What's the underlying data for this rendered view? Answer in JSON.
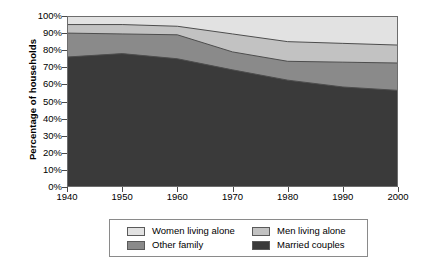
{
  "chart_data": {
    "type": "area",
    "stacked": true,
    "title": "",
    "xlabel": "",
    "ylabel": "Percentage of households",
    "x": [
      1940,
      1950,
      1960,
      1970,
      1980,
      1990,
      2000
    ],
    "xlim": [
      1940,
      2000
    ],
    "ylim": [
      0,
      100
    ],
    "grid": false,
    "legend_position": "bottom",
    "x_tick_labels": [
      "1940",
      "1950",
      "1960",
      "1970",
      "1980",
      "1990",
      "2000"
    ],
    "y_tick_labels": [
      "0%",
      "10%",
      "20%",
      "30%",
      "40%",
      "50%",
      "60%",
      "70%",
      "80%",
      "90%",
      "100%"
    ],
    "y_tick_values": [
      0,
      10,
      20,
      30,
      40,
      50,
      60,
      70,
      80,
      90,
      100
    ],
    "series": [
      {
        "name": "Married couples",
        "color": "#3a3a3a",
        "values": [
          76,
          78,
          75,
          68.5,
          62.5,
          58.5,
          56.5
        ]
      },
      {
        "name": "Other family",
        "color": "#8a8a8a",
        "values": [
          14,
          11.5,
          14,
          10.5,
          11,
          14.5,
          16
        ]
      },
      {
        "name": "Men living alone",
        "color": "#c2c2c2",
        "values": [
          5,
          5.5,
          5,
          10.5,
          11.5,
          11,
          10.5
        ]
      },
      {
        "name": "Women living alone",
        "color": "#e2e2e2",
        "values": [
          5,
          5,
          6,
          10.5,
          15,
          16,
          17
        ]
      }
    ],
    "cumulative_tops": {
      "married_couples": [
        76,
        78,
        75,
        68.5,
        62.5,
        58.5,
        56.5
      ],
      "plus_other_family": [
        90,
        89.5,
        89,
        79,
        73.5,
        73,
        72.5
      ],
      "plus_men_living_alone": [
        95,
        95,
        94,
        89.5,
        85,
        84,
        83
      ],
      "plus_women_living_alone": [
        100,
        100,
        100,
        100,
        100,
        100,
        100
      ]
    }
  },
  "axes": {
    "y_title": "Percentage of households"
  },
  "legend": {
    "rows": [
      {
        "left": {
          "label": "Women living alone",
          "color": "#e2e2e2"
        },
        "right": {
          "label": "Men living alone",
          "color": "#c2c2c2"
        }
      },
      {
        "left": {
          "label": "Other family",
          "color": "#8a8a8a"
        },
        "right": {
          "label": "Married couples",
          "color": "#3a3a3a"
        }
      }
    ]
  }
}
